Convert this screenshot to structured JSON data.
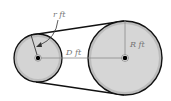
{
  "diagram": {
    "small_pulley": {
      "radius_label": "r ft",
      "center": [
        38,
        58
      ],
      "radius": 24
    },
    "large_pulley": {
      "radius_label": "R ft",
      "center": [
        125,
        58
      ],
      "radius": 37
    },
    "distance_label": "D ft",
    "colors": {
      "belt": "#111111",
      "pulley_fill": "#cfcfcf",
      "pulley_rim": "#9a9a9a",
      "hub": "#000000",
      "line": "#8a8a8a"
    }
  }
}
